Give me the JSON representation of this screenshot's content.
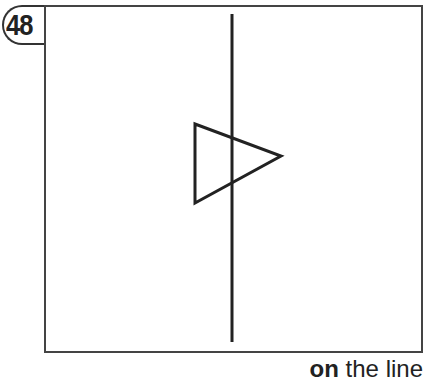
{
  "badge": {
    "number": "48"
  },
  "figure": {
    "vertical_line": {
      "x": 232,
      "y1": 14,
      "y2": 342
    },
    "triangle": {
      "points": [
        [
          195,
          124
        ],
        [
          195,
          203
        ],
        [
          281,
          156
        ]
      ]
    },
    "stroke_color": "#222222"
  },
  "caption": {
    "bold": "on",
    "rest": " the line"
  }
}
